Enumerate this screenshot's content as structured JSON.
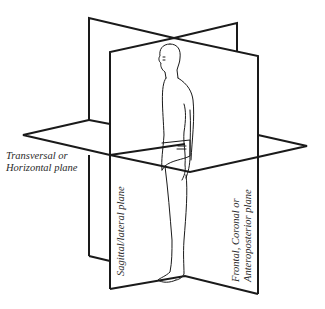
{
  "figure": {
    "labels": {
      "transversal": [
        "Transversal or",
        "Horizontal plane"
      ],
      "sagittal": "Sagittal/lateral plane",
      "frontal": [
        "Frontal, Coronal or",
        "Anteroposterior plane"
      ]
    },
    "colors": {
      "line": "#1a1a1a",
      "text": "#2a2a2a",
      "background": "#ffffff"
    }
  }
}
